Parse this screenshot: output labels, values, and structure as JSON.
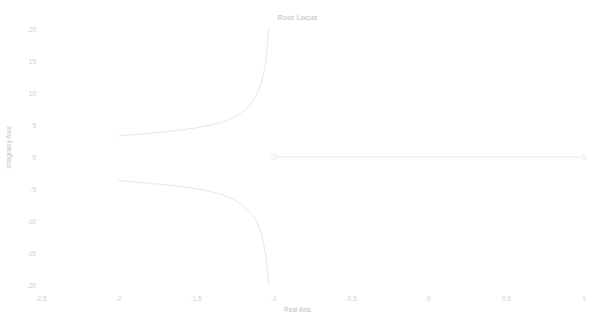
{
  "chart_data": {
    "type": "line",
    "title": "Root Locus",
    "xlabel": "Real Axis",
    "ylabel": "Imaginary Axis",
    "xlim": [
      -2.5,
      1.0
    ],
    "ylim": [
      -20,
      20
    ],
    "xticks": [
      -2.5,
      -2,
      -1.5,
      -1,
      -0.5,
      0,
      0.5,
      1
    ],
    "xticklabels": [
      "-2.5",
      "-2",
      "-1.5",
      "-1",
      "-0.5",
      "0",
      "0.5",
      "1"
    ],
    "yticks": [
      20,
      15,
      10,
      5,
      0,
      -5,
      -10,
      -15,
      -20
    ],
    "yticklabels": [
      "20",
      "15",
      "10",
      "5",
      "0",
      "-5",
      "-10",
      "-15",
      "-20"
    ],
    "grid": false,
    "legend": "none",
    "line_color": "#e8e8e8",
    "marker_color": "#ededed",
    "series": [
      {
        "name": "upper-branch",
        "points": [
          [
            -2.0,
            3.3
          ],
          [
            -1.92,
            3.45
          ],
          [
            -1.84,
            3.62
          ],
          [
            -1.76,
            3.8
          ],
          [
            -1.68,
            4.0
          ],
          [
            -1.6,
            4.22
          ],
          [
            -1.52,
            4.48
          ],
          [
            -1.45,
            4.78
          ],
          [
            -1.38,
            5.15
          ],
          [
            -1.32,
            5.6
          ],
          [
            -1.27,
            6.1
          ],
          [
            -1.22,
            6.75
          ],
          [
            -1.18,
            7.5
          ],
          [
            -1.15,
            8.3
          ],
          [
            -1.12,
            9.3
          ],
          [
            -1.1,
            10.3
          ],
          [
            -1.08,
            11.5
          ],
          [
            -1.07,
            12.6
          ],
          [
            -1.06,
            13.8
          ],
          [
            -1.05,
            15.1
          ],
          [
            -1.045,
            16.4
          ],
          [
            -1.04,
            17.7
          ],
          [
            -1.035,
            19.0
          ],
          [
            -1.03,
            20.0
          ]
        ]
      },
      {
        "name": "lower-branch",
        "points": [
          [
            -2.0,
            -3.7
          ],
          [
            -1.92,
            -3.85
          ],
          [
            -1.84,
            -4.02
          ],
          [
            -1.76,
            -4.2
          ],
          [
            -1.68,
            -4.4
          ],
          [
            -1.6,
            -4.62
          ],
          [
            -1.52,
            -4.88
          ],
          [
            -1.45,
            -5.18
          ],
          [
            -1.38,
            -5.55
          ],
          [
            -1.32,
            -6.0
          ],
          [
            -1.27,
            -6.5
          ],
          [
            -1.22,
            -7.15
          ],
          [
            -1.18,
            -7.9
          ],
          [
            -1.15,
            -8.7
          ],
          [
            -1.12,
            -9.7
          ],
          [
            -1.1,
            -10.7
          ],
          [
            -1.08,
            -11.9
          ],
          [
            -1.07,
            -13.0
          ],
          [
            -1.06,
            -14.2
          ],
          [
            -1.05,
            -15.5
          ],
          [
            -1.045,
            -16.8
          ],
          [
            -1.04,
            -18.1
          ],
          [
            -1.035,
            -19.4
          ],
          [
            -1.03,
            -20.0
          ]
        ]
      },
      {
        "name": "real-axis-branch",
        "points": [
          [
            -1.0,
            0.0
          ],
          [
            1.0,
            0.0
          ]
        ]
      }
    ],
    "markers": [
      {
        "name": "pole-marker",
        "x": -1.0,
        "y": 0.0,
        "symbol": "circle"
      },
      {
        "name": "zero-marker",
        "x": 1.0,
        "y": 0.0,
        "symbol": "circle"
      }
    ]
  }
}
